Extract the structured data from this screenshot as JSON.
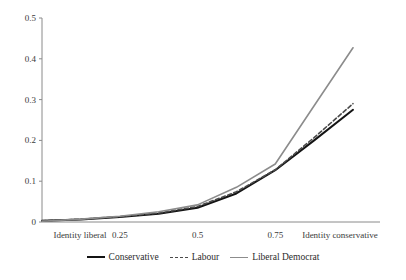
{
  "chart_data": {
    "type": "line",
    "title": "",
    "xlabel": "",
    "ylabel": "",
    "xlim": [
      0,
      1
    ],
    "ylim": [
      0,
      0.5
    ],
    "grid": false,
    "legend_position": "bottom",
    "x_tick_positions": [
      0,
      0.25,
      0.5,
      0.75,
      1
    ],
    "x_tick_labels": [
      "Identity liberal",
      "0.25",
      "0.5",
      "0.75",
      "Identity conservative"
    ],
    "y_tick_positions": [
      0,
      0.1,
      0.2,
      0.3,
      0.4,
      0.5
    ],
    "y_tick_labels": [
      "0",
      "0.1",
      "0.2",
      "0.3",
      "0.4",
      "0.5"
    ],
    "x": [
      0,
      0.125,
      0.25,
      0.375,
      0.5,
      0.625,
      0.75,
      0.875,
      1
    ],
    "series": [
      {
        "name": "Conservative",
        "color": "#141414",
        "style": "solid",
        "values": [
          0.003,
          0.006,
          0.012,
          0.02,
          0.035,
          0.07,
          0.127,
          0.2,
          0.275
        ]
      },
      {
        "name": "Labour",
        "color": "#4a4a4a",
        "style": "dashed",
        "values": [
          0.003,
          0.007,
          0.013,
          0.022,
          0.038,
          0.074,
          0.128,
          0.207,
          0.29
        ]
      },
      {
        "name": "Liberal Democrat",
        "color": "#8c8c8c",
        "style": "solid",
        "values": [
          0.002,
          0.007,
          0.014,
          0.025,
          0.042,
          0.085,
          0.142,
          0.285,
          0.427
        ]
      }
    ]
  },
  "legend": {
    "items": [
      {
        "label": "Conservative"
      },
      {
        "label": "Labour"
      },
      {
        "label": "Liberal Democrat"
      }
    ]
  },
  "axes": {
    "y_ticks": [
      {
        "label": "0.5"
      },
      {
        "label": "0.4"
      },
      {
        "label": "0.3"
      },
      {
        "label": "0.2"
      },
      {
        "label": "0.1"
      },
      {
        "label": "0"
      }
    ],
    "x_ticks": [
      {
        "label": "Identity liberal"
      },
      {
        "label": "0.25"
      },
      {
        "label": "0.5"
      },
      {
        "label": "0.75"
      },
      {
        "label": "Identity conservative"
      }
    ]
  }
}
